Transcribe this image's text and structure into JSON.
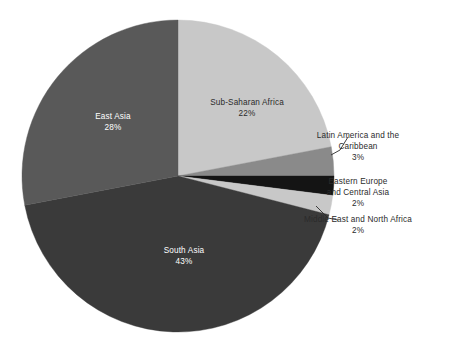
{
  "chart_data": {
    "type": "pie",
    "title": "",
    "subtitle": "",
    "xlabel": "",
    "ylabel": "",
    "legend_position": "none",
    "grid": false,
    "value_unit": "percent",
    "start_angle_deg": 0,
    "direction": "clockwise",
    "categories": [
      "Sub-Saharan Africa",
      "Latin America and the Caribbean",
      "Eastern Europe and Central Asia",
      "Middle East and North Africa",
      "South Asia",
      "East Asia"
    ],
    "values": [
      22,
      3,
      2,
      2,
      43,
      28
    ],
    "slices": [
      {
        "label": "Sub-Saharan Africa",
        "value": 22,
        "value_text": "22%",
        "color": "#c8c8c8",
        "start_deg": 0,
        "end_deg": 79.2,
        "label_style": "inside",
        "label_text_color": "#2b2b2b",
        "label_x": 247,
        "label_y": 103,
        "label_x2": 247,
        "label_y2": 114
      },
      {
        "label": "Latin America and the",
        "label_line2": "Caribbean",
        "value": 3,
        "value_text": "3%",
        "color": "#8a8a8a",
        "start_deg": 79.2,
        "end_deg": 90,
        "label_style": "callout",
        "label_text_color": "#2b2b2b",
        "label_x": 358,
        "label_y": 136,
        "label_y2": 147,
        "label_y3": 158
      },
      {
        "label": "Eastern Europe",
        "label_line2": "and Central Asia",
        "value": 2,
        "value_text": "2%",
        "color": "#141414",
        "start_deg": 90,
        "end_deg": 97.2,
        "label_style": "callout",
        "label_text_color": "#2b2b2b",
        "label_x": 358,
        "label_y": 182,
        "label_y2": 193,
        "label_y3": 204
      },
      {
        "label": "Middle East and North Africa",
        "value": 2,
        "value_text": "2%",
        "color": "#c8c8c8",
        "start_deg": 97.2,
        "end_deg": 104.4,
        "label_style": "callout",
        "label_text_color": "#2b2b2b",
        "label_x": 358,
        "label_y": 220,
        "label_y2": 231
      },
      {
        "label": "South Asia",
        "value": 43,
        "value_text": "43%",
        "color": "#3a3a3a",
        "start_deg": 104.4,
        "end_deg": 259.2,
        "label_style": "inside",
        "label_text_color": "#ffffff",
        "label_x": 184,
        "label_y": 251,
        "label_x2": 184,
        "label_y2": 262
      },
      {
        "label": "East Asia",
        "value": 28,
        "value_text": "28%",
        "color": "#595959",
        "start_deg": 259.2,
        "end_deg": 360,
        "label_style": "inside",
        "label_text_color": "#ffffff",
        "label_x": 113,
        "label_y": 117,
        "label_x2": 113,
        "label_y2": 128
      }
    ],
    "geometry": {
      "center_x": 178,
      "center_y": 176,
      "radius": 156
    },
    "background_color": "#ffffff"
  }
}
